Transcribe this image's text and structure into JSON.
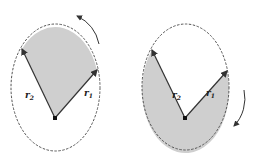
{
  "figures": [
    {
      "id": "left",
      "vectors": [
        {
          "name": "r",
          "subscript": "2"
        },
        {
          "name": "r",
          "subscript": "1"
        }
      ],
      "rotation": "counterclockwise",
      "shaded_region": "sector swept between r1 and r2 (upper)"
    },
    {
      "id": "right",
      "vectors": [
        {
          "name": "r",
          "subscript": "2"
        },
        {
          "name": "r",
          "subscript": "1"
        }
      ],
      "rotation": "clockwise",
      "shaded_region": "sector swept between r1 and r2 (lower)"
    }
  ],
  "colors": {
    "shade": "#cfcfcf",
    "line": "#333333",
    "dash": "#555555"
  }
}
